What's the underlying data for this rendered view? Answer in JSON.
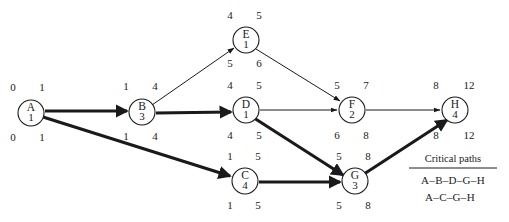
{
  "diagram": {
    "type": "project-network-cpm",
    "width": 509,
    "height": 222,
    "background_color": "#ffffff",
    "line_color": "#1a1a1a",
    "nodes": [
      {
        "id": "A",
        "label": "A",
        "duration": "1",
        "cx": 31,
        "cy": 113,
        "r": 13,
        "early_start": "0",
        "early_finish": "1",
        "late_start": "0",
        "late_finish": "1",
        "top_left_x": 13,
        "top_right_x": 42,
        "top_y": 91,
        "bot_left_x": 13,
        "bot_right_x": 42,
        "bot_y": 141
      },
      {
        "id": "B",
        "label": "B",
        "duration": "3",
        "cx": 142,
        "cy": 112,
        "r": 13,
        "early_start": "1",
        "early_finish": "4",
        "late_start": "1",
        "late_finish": "4",
        "top_left_x": 126,
        "top_right_x": 155,
        "top_y": 90,
        "bot_left_x": 126,
        "bot_right_x": 155,
        "bot_y": 140
      },
      {
        "id": "C",
        "label": "C",
        "duration": "4",
        "cx": 245,
        "cy": 181,
        "r": 13,
        "early_start": "1",
        "early_finish": "5",
        "late_start": "1",
        "late_finish": "5",
        "top_left_x": 230,
        "top_right_x": 258,
        "top_y": 160,
        "bot_left_x": 230,
        "bot_right_x": 258,
        "bot_y": 209
      },
      {
        "id": "D",
        "label": "D",
        "duration": "1",
        "cx": 246,
        "cy": 110,
        "r": 13,
        "early_start": "4",
        "early_finish": "5",
        "late_start": "4",
        "late_finish": "5",
        "top_left_x": 230,
        "top_right_x": 259,
        "top_y": 89,
        "bot_left_x": 230,
        "bot_right_x": 259,
        "bot_y": 139
      },
      {
        "id": "E",
        "label": "E",
        "duration": "1",
        "cx": 246,
        "cy": 40,
        "r": 13,
        "early_start": "4",
        "early_finish": "5",
        "late_start": "5",
        "late_finish": "6",
        "top_left_x": 230,
        "top_right_x": 259,
        "top_y": 19,
        "bot_left_x": 230,
        "bot_right_x": 259,
        "bot_y": 67
      },
      {
        "id": "F",
        "label": "F",
        "duration": "2",
        "cx": 352,
        "cy": 110,
        "r": 13,
        "early_start": "5",
        "early_finish": "7",
        "late_start": "6",
        "late_finish": "8",
        "top_left_x": 337,
        "top_right_x": 366,
        "top_y": 89,
        "bot_left_x": 337,
        "bot_right_x": 366,
        "bot_y": 139
      },
      {
        "id": "G",
        "label": "G",
        "duration": "3",
        "cx": 355,
        "cy": 181,
        "r": 13,
        "early_start": "5",
        "early_finish": "8",
        "late_start": "5",
        "late_finish": "8",
        "top_left_x": 339,
        "top_right_x": 368,
        "top_y": 160,
        "bot_left_x": 339,
        "bot_right_x": 368,
        "bot_y": 209
      },
      {
        "id": "H",
        "label": "H",
        "duration": "4",
        "cx": 455,
        "cy": 110,
        "r": 13,
        "early_start": "8",
        "early_finish": "12",
        "late_start": "8",
        "late_finish": "12",
        "top_left_x": 436,
        "top_right_x": 469,
        "top_y": 89,
        "bot_left_x": 436,
        "bot_right_x": 469,
        "bot_y": 139
      }
    ],
    "edges": [
      {
        "from": "A",
        "to": "B",
        "critical": true,
        "x1": 45,
        "y1": 111,
        "x2": 127,
        "y2": 111
      },
      {
        "from": "A",
        "to": "C",
        "critical": true,
        "x1": 43,
        "y1": 117,
        "x2": 230,
        "y2": 176
      },
      {
        "from": "B",
        "to": "E",
        "critical": false,
        "x1": 152,
        "y1": 105,
        "x2": 234,
        "y2": 48
      },
      {
        "from": "B",
        "to": "D",
        "critical": true,
        "x1": 156,
        "y1": 113,
        "x2": 231,
        "y2": 112
      },
      {
        "from": "E",
        "to": "F",
        "critical": false,
        "x1": 256,
        "y1": 49,
        "x2": 340,
        "y2": 101
      },
      {
        "from": "D",
        "to": "F",
        "critical": false,
        "x1": 260,
        "y1": 110,
        "x2": 337,
        "y2": 110
      },
      {
        "from": "D",
        "to": "G",
        "critical": true,
        "x1": 254,
        "y1": 118,
        "x2": 343,
        "y2": 175
      },
      {
        "from": "C",
        "to": "G",
        "critical": true,
        "x1": 259,
        "y1": 182,
        "x2": 340,
        "y2": 182
      },
      {
        "from": "F",
        "to": "H",
        "critical": false,
        "x1": 366,
        "y1": 110,
        "x2": 440,
        "y2": 110
      },
      {
        "from": "G",
        "to": "H",
        "critical": true,
        "x1": 364,
        "y1": 174,
        "x2": 447,
        "y2": 120
      }
    ]
  },
  "legend": {
    "title": "Critical paths",
    "title_x": 453,
    "title_y": 162,
    "rule_x1": 409,
    "rule_x2": 497,
    "rule_y": 168,
    "paths": [
      {
        "text": "A–B–D–G–H",
        "x": 453,
        "y": 184
      },
      {
        "text": "A–C–G–H",
        "x": 450,
        "y": 201
      }
    ]
  }
}
